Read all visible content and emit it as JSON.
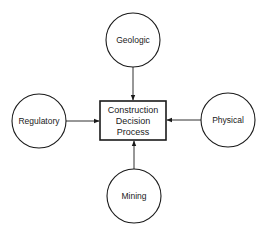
{
  "diagram": {
    "center": {
      "lines": [
        "Construction",
        "Decision",
        "Process"
      ]
    },
    "nodes": [
      {
        "id": "geologic",
        "label": "Geologic",
        "position": "top"
      },
      {
        "id": "regulatory",
        "label": "Regulatory",
        "position": "left"
      },
      {
        "id": "physical",
        "label": "Physical",
        "position": "right"
      },
      {
        "id": "mining",
        "label": "Mining",
        "position": "bottom"
      }
    ],
    "edges": [
      {
        "from": "geologic",
        "to": "center"
      },
      {
        "from": "regulatory",
        "to": "center"
      },
      {
        "from": "physical",
        "to": "center"
      },
      {
        "from": "mining",
        "to": "center"
      }
    ]
  }
}
